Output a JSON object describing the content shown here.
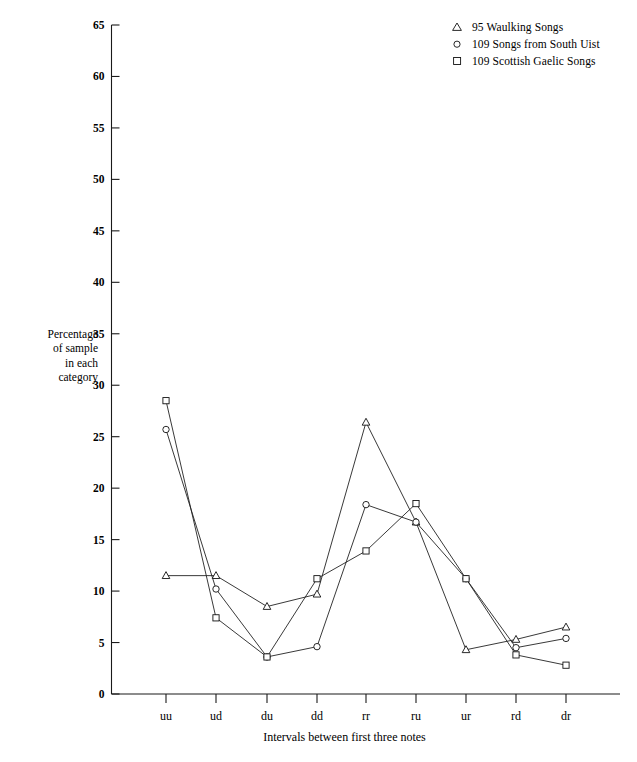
{
  "legend": {
    "items": [
      {
        "symbol": "triangle-marker-icon",
        "label": "95 Waulking Songs"
      },
      {
        "symbol": "circle-marker-icon",
        "label": "109 Songs from South Uist"
      },
      {
        "symbol": "square-marker-icon",
        "label": "109 Scottish Gaelic Songs"
      }
    ]
  },
  "axes": {
    "ylabel_lines": [
      "Percentage",
      "of sample",
      "in each",
      "category"
    ],
    "xlabel": "Intervals between first three notes",
    "yticks": [
      "0",
      "5",
      "10",
      "15",
      "20",
      "25",
      "30",
      "35",
      "40",
      "45",
      "50",
      "55",
      "60",
      "65"
    ],
    "xticks": [
      "uu",
      "ud",
      "du",
      "dd",
      "rr",
      "ru",
      "ur",
      "rd",
      "dr"
    ]
  },
  "chart_data": {
    "type": "line",
    "title": "",
    "xlabel": "Intervals between first three notes",
    "ylabel": "Percentage of sample in each category",
    "categories": [
      "uu",
      "ud",
      "du",
      "dd",
      "rr",
      "ru",
      "ur",
      "rd",
      "dr"
    ],
    "ylim": [
      0,
      65
    ],
    "ytick_step": 5,
    "grid": false,
    "legend_position": "top-right",
    "series": [
      {
        "name": "95 Waulking Songs",
        "marker": "triangle",
        "values": [
          11.5,
          11.5,
          8.5,
          9.7,
          26.4,
          16.7,
          4.3,
          5.3,
          6.5
        ]
      },
      {
        "name": "109 Songs from South Uist",
        "marker": "circle",
        "values": [
          25.7,
          10.2,
          3.6,
          4.6,
          18.4,
          16.7,
          11.2,
          4.5,
          5.4
        ]
      },
      {
        "name": "109 Scottish Gaelic Songs",
        "marker": "square",
        "values": [
          28.5,
          7.4,
          3.6,
          11.2,
          13.9,
          18.5,
          11.2,
          3.8,
          2.8
        ]
      }
    ]
  }
}
